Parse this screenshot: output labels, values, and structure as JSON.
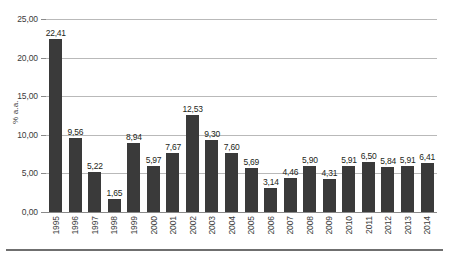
{
  "chart_data": {
    "type": "bar",
    "title": "",
    "subtitle": "",
    "xlabel": "",
    "ylabel": "% a.a.",
    "ylim": [
      0,
      25
    ],
    "grid": true,
    "legend": null,
    "decimal_separator": ",",
    "categories": [
      "1995",
      "1996",
      "1997",
      "1998",
      "1999",
      "2000",
      "2001",
      "2002",
      "2003",
      "2004",
      "2005",
      "2006",
      "2007",
      "2008",
      "2009",
      "2010",
      "2011",
      "2012",
      "2013",
      "2014"
    ],
    "values": [
      22.41,
      9.56,
      5.22,
      1.65,
      8.94,
      5.97,
      7.67,
      12.53,
      9.3,
      7.6,
      5.69,
      3.14,
      4.46,
      5.9,
      4.31,
      5.91,
      6.5,
      5.84,
      5.91,
      6.41
    ],
    "value_labels": [
      "22,41",
      "9,56",
      "5,22",
      "1,65",
      "8,94",
      "5,97",
      "7,67",
      "12,53",
      "9,30",
      "7,60",
      "5,69",
      "3,14",
      "4,46",
      "5,90",
      "4,31",
      "5,91",
      "6,50",
      "5,84",
      "5,91",
      "6,41"
    ],
    "yticks": [
      0,
      5,
      10,
      15,
      20,
      25
    ],
    "ytick_labels": [
      "0,00",
      "5,00",
      "10,00",
      "15,00",
      "20,00",
      "25,00"
    ],
    "bar_color": "#3a3a3a",
    "gridline_color": "#b9b9b9",
    "axis_color": "#8a8a8a",
    "background_color": "#ffffff"
  },
  "caption": ""
}
